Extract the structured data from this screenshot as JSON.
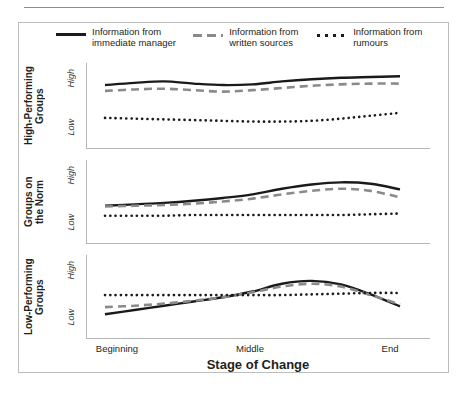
{
  "figure": {
    "legend": [
      {
        "key": "solid",
        "label": "Information from\nimmediate manager",
        "color": "#1a1a1a"
      },
      {
        "key": "dashed",
        "label": "Information from\nwritten sources",
        "color": "#8a8a8a"
      },
      {
        "key": "dotted",
        "label": "Information from\nrumours",
        "color": "#1a1a1a"
      }
    ],
    "x_axis": {
      "title": "Stage of Change",
      "ticks": [
        "Beginning",
        "Middle",
        "End"
      ]
    },
    "y_axis": {
      "ticks": [
        "High",
        "Low"
      ]
    },
    "panels": [
      {
        "label": "High-Performing\nGroups"
      },
      {
        "label": "Groups on\nthe Norm"
      },
      {
        "label": "Low-Performing\nGroups"
      }
    ]
  },
  "chart_data": {
    "type": "line",
    "title": "",
    "xlabel": "Stage of Change",
    "ylabel": "",
    "x": [
      0,
      0.1,
      0.2,
      0.3,
      0.4,
      0.5,
      0.6,
      0.7,
      0.8,
      0.9,
      1.0
    ],
    "xtick_positions": [
      0.0,
      0.5,
      1.0
    ],
    "xtick_labels": [
      "Beginning",
      "Middle",
      "End"
    ],
    "ytick_labels": [
      "Low",
      "High"
    ],
    "ylim": [
      0,
      1
    ],
    "grid": false,
    "legend_position": "top",
    "panels": [
      {
        "name": "High-Performing Groups",
        "series": [
          {
            "name": "Information from immediate manager",
            "style": "solid",
            "color": "#1a1a1a",
            "values": [
              0.78,
              0.81,
              0.83,
              0.8,
              0.78,
              0.79,
              0.83,
              0.86,
              0.88,
              0.89,
              0.9
            ]
          },
          {
            "name": "Information from written sources",
            "style": "dashed",
            "color": "#8a8a8a",
            "values": [
              0.7,
              0.72,
              0.73,
              0.71,
              0.69,
              0.71,
              0.74,
              0.77,
              0.79,
              0.8,
              0.8
            ]
          },
          {
            "name": "Information from rumours",
            "style": "dotted",
            "color": "#1a1a1a",
            "values": [
              0.33,
              0.32,
              0.31,
              0.3,
              0.29,
              0.28,
              0.28,
              0.29,
              0.32,
              0.36,
              0.4
            ]
          }
        ]
      },
      {
        "name": "Groups on the Norm",
        "series": [
          {
            "name": "Information from immediate manager",
            "style": "solid",
            "color": "#1a1a1a",
            "values": [
              0.44,
              0.46,
              0.48,
              0.51,
              0.55,
              0.6,
              0.68,
              0.74,
              0.77,
              0.75,
              0.67
            ]
          },
          {
            "name": "Information from written sources",
            "style": "dashed",
            "color": "#8a8a8a",
            "values": [
              0.43,
              0.44,
              0.45,
              0.47,
              0.5,
              0.54,
              0.6,
              0.65,
              0.68,
              0.65,
              0.56
            ]
          },
          {
            "name": "Information from rumours",
            "style": "dotted",
            "color": "#1a1a1a",
            "values": [
              0.3,
              0.3,
              0.3,
              0.31,
              0.31,
              0.31,
              0.31,
              0.31,
              0.31,
              0.32,
              0.33
            ]
          }
        ]
      },
      {
        "name": "Low-Performing Groups",
        "series": [
          {
            "name": "Information from immediate manager",
            "style": "solid",
            "color": "#1a1a1a",
            "values": [
              0.25,
              0.31,
              0.37,
              0.43,
              0.49,
              0.57,
              0.68,
              0.72,
              0.67,
              0.53,
              0.36
            ]
          },
          {
            "name": "Information from written sources",
            "style": "dashed",
            "color": "#8a8a8a",
            "values": [
              0.35,
              0.37,
              0.4,
              0.44,
              0.49,
              0.56,
              0.64,
              0.68,
              0.64,
              0.52,
              0.39
            ]
          },
          {
            "name": "Information from rumours",
            "style": "dotted",
            "color": "#1a1a1a",
            "values": [
              0.52,
              0.52,
              0.52,
              0.52,
              0.52,
              0.52,
              0.52,
              0.53,
              0.54,
              0.55,
              0.55
            ]
          }
        ]
      }
    ]
  }
}
